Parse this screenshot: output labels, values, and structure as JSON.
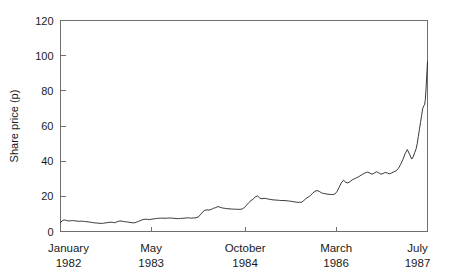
{
  "chart_data": {
    "type": "line",
    "title": "",
    "xlabel": "",
    "ylabel": "Share price (p)",
    "ylim": [
      0,
      120
    ],
    "yticks": [
      0,
      20,
      40,
      60,
      80,
      100,
      120
    ],
    "ytick_labels": [
      "0",
      "20",
      "40",
      "60",
      "80",
      "100",
      "120"
    ],
    "grid": false,
    "legend": "none",
    "xtick_labels": [
      {
        "month": "January",
        "year": "1982"
      },
      {
        "month": "May",
        "year": "1983"
      },
      {
        "month": "October",
        "year": "1984"
      },
      {
        "month": "March",
        "year": "1986"
      },
      {
        "month": "July",
        "year": "1987"
      }
    ],
    "xtick_positions_frac": [
      0.0,
      0.247,
      0.503,
      0.751,
      1.0
    ],
    "line_color": "#222222",
    "frame_color": "#6f6f6f",
    "background_color": "#ffffff",
    "x_domain_frac": [
      0,
      1
    ],
    "series": [
      {
        "name": "Share price",
        "x_frac": [
          0.0,
          0.005,
          0.01,
          0.016,
          0.021,
          0.027,
          0.033,
          0.039,
          0.045,
          0.051,
          0.057,
          0.063,
          0.069,
          0.075,
          0.081,
          0.087,
          0.093,
          0.099,
          0.105,
          0.111,
          0.117,
          0.123,
          0.129,
          0.135,
          0.141,
          0.147,
          0.153,
          0.159,
          0.165,
          0.171,
          0.177,
          0.183,
          0.189,
          0.195,
          0.201,
          0.207,
          0.213,
          0.219,
          0.225,
          0.231,
          0.237,
          0.243,
          0.249,
          0.255,
          0.261,
          0.267,
          0.273,
          0.279,
          0.285,
          0.291,
          0.297,
          0.303,
          0.309,
          0.315,
          0.321,
          0.327,
          0.333,
          0.339,
          0.345,
          0.351,
          0.357,
          0.363,
          0.369,
          0.375,
          0.381,
          0.387,
          0.393,
          0.399,
          0.405,
          0.411,
          0.417,
          0.423,
          0.429,
          0.435,
          0.441,
          0.447,
          0.453,
          0.459,
          0.465,
          0.471,
          0.477,
          0.483,
          0.489,
          0.495,
          0.501,
          0.507,
          0.513,
          0.519,
          0.525,
          0.531,
          0.537,
          0.543,
          0.549,
          0.555,
          0.561,
          0.567,
          0.573,
          0.579,
          0.585,
          0.591,
          0.597,
          0.603,
          0.609,
          0.615,
          0.621,
          0.627,
          0.633,
          0.639,
          0.645,
          0.651,
          0.657,
          0.663,
          0.669,
          0.675,
          0.681,
          0.687,
          0.693,
          0.699,
          0.705,
          0.711,
          0.717,
          0.723,
          0.729,
          0.735,
          0.741,
          0.747,
          0.753,
          0.759,
          0.765,
          0.771,
          0.777,
          0.783,
          0.789,
          0.795,
          0.801,
          0.807,
          0.813,
          0.819,
          0.825,
          0.831,
          0.837,
          0.843,
          0.849,
          0.855,
          0.861,
          0.867,
          0.873,
          0.879,
          0.885,
          0.891,
          0.897,
          0.903,
          0.909,
          0.915,
          0.921,
          0.927,
          0.933,
          0.939,
          0.945,
          0.951,
          0.957,
          0.961,
          0.965,
          0.969,
          0.972,
          0.975,
          0.978,
          0.981,
          0.984,
          0.987,
          0.99,
          0.992,
          0.994,
          0.996,
          0.998,
          1.0
        ],
        "values": [
          5.0,
          6.2,
          6.6,
          6.3,
          6.0,
          6.1,
          6.2,
          6.1,
          5.9,
          5.8,
          5.9,
          5.8,
          5.6,
          5.5,
          5.3,
          5.1,
          4.9,
          4.8,
          4.7,
          4.6,
          4.7,
          4.9,
          5.1,
          5.3,
          5.2,
          5.0,
          5.4,
          5.9,
          6.0,
          5.7,
          5.5,
          5.4,
          5.2,
          5.0,
          4.9,
          5.3,
          5.8,
          6.3,
          6.8,
          7.0,
          6.9,
          6.8,
          7.0,
          7.2,
          7.4,
          7.5,
          7.6,
          7.6,
          7.5,
          7.6,
          7.7,
          7.6,
          7.5,
          7.4,
          7.3,
          7.4,
          7.5,
          7.6,
          7.8,
          7.7,
          7.6,
          7.7,
          7.8,
          8.2,
          9.5,
          11.0,
          12.0,
          12.3,
          12.2,
          12.6,
          13.2,
          13.6,
          14.2,
          13.8,
          13.4,
          13.2,
          13.0,
          12.9,
          12.8,
          12.7,
          12.7,
          12.6,
          12.6,
          12.8,
          13.6,
          15.0,
          16.4,
          17.6,
          18.4,
          19.8,
          20.2,
          19.0,
          18.6,
          18.9,
          18.7,
          18.4,
          18.2,
          18.0,
          17.9,
          17.8,
          17.7,
          17.6,
          17.6,
          17.5,
          17.4,
          17.2,
          17.0,
          16.8,
          16.6,
          16.6,
          16.7,
          17.6,
          18.8,
          19.6,
          20.4,
          21.8,
          22.8,
          23.3,
          22.8,
          22.0,
          21.6,
          21.4,
          21.2,
          21.1,
          21.0,
          21.2,
          22.6,
          25.0,
          27.6,
          29.2,
          28.0,
          27.6,
          28.4,
          29.4,
          30.0,
          30.6,
          31.2,
          32.0,
          32.8,
          33.4,
          33.8,
          33.2,
          32.6,
          33.2,
          34.0,
          33.4,
          32.6,
          33.0,
          33.6,
          33.2,
          32.8,
          33.4,
          34.0,
          34.6,
          36.0,
          38.2,
          41.0,
          44.2,
          46.6,
          44.0,
          41.2,
          42.4,
          44.8,
          47.0,
          50.0,
          54.0,
          58.0,
          62.0,
          66.0,
          70.0,
          71.5,
          72.0,
          75.0,
          81.0,
          89.0,
          96.5
        ]
      }
    ]
  },
  "axes": {
    "y_title": "Share price (p)"
  }
}
